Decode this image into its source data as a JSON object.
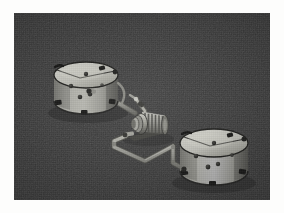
{
  "image": {
    "title": "Industrial Fluid Transfer Skid",
    "description": "Dark photographic view of two cylindrical storage tanks connected by piping through a centrally mounted motor-driven pump.",
    "caption": "",
    "background_color": "#3b3b3b",
    "page_color": "#fdfdfc",
    "panel": {
      "x": 14,
      "y": 13,
      "width": 256,
      "height": 187
    }
  },
  "palette": {
    "background_dark": "#3b3b3b",
    "background_shadow": "#2e2e2e",
    "tank_light": "#b9b9b3",
    "tank_mid": "#9a9a94",
    "tank_shade": "#7c7c77",
    "tank_dark_edge": "#2a2a28",
    "tank_top_light": "#c9c9c2",
    "tank_top_mid": "#a9a9a2",
    "pipe_light": "#a6a6a0",
    "pipe_shade": "#6e6e69",
    "pump_light": "#bdbdb6",
    "pump_mid": "#8e8e88",
    "pump_dark": "#4a4a46",
    "bolt_dark": "#262624",
    "fitting_dark": "#1f1f1e"
  },
  "objects": {
    "tank_left": {
      "label": "Left storage tank",
      "name": "tank-left",
      "center": {
        "x": 72,
        "y": 62
      },
      "radius_x": 32,
      "radius_y": 13,
      "body_height": 58,
      "bolt_count": 4,
      "foot_count": 3,
      "has_lid_seam": true
    },
    "tank_right": {
      "label": "Right storage tank",
      "name": "tank-right",
      "center": {
        "x": 200,
        "y": 130
      },
      "radius_x": 34,
      "radius_y": 14,
      "body_height": 60,
      "bolt_count": 4,
      "foot_count": 3,
      "has_lid_seam": true
    },
    "pump_unit": {
      "label": "Motor driven pump",
      "name": "pump-motor-unit",
      "center": {
        "x": 134,
        "y": 112
      },
      "body_length": 40,
      "body_height": 26,
      "fin_count": 7,
      "has_inlet_riser": true,
      "has_outlet_nozzle": true
    },
    "pipe_suction": {
      "label": "Suction pipe from left tank to pump",
      "name": "pipe-suction",
      "from": "tank_left",
      "to": "pump_unit"
    },
    "pipe_discharge": {
      "label": "Discharge pipe from pump to right tank",
      "name": "pipe-discharge",
      "from": "pump_unit",
      "to": "tank_right"
    },
    "riser_valve": {
      "label": "Angled riser valve above pump",
      "name": "riser-valve",
      "position": {
        "x": 127,
        "y": 95
      }
    }
  },
  "annotations": []
}
